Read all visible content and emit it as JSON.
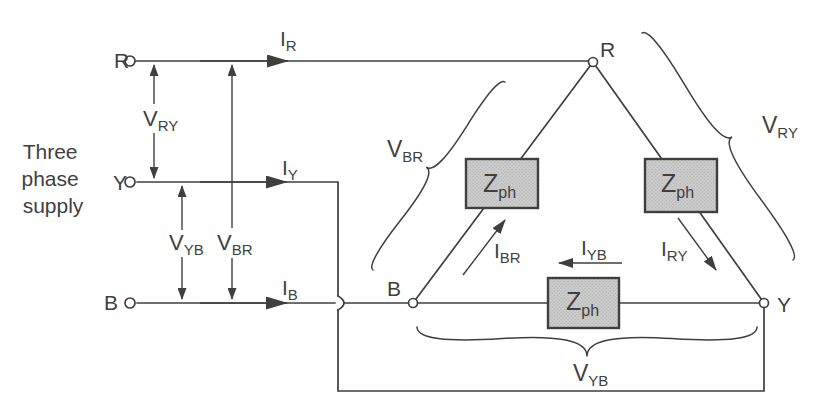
{
  "figure": {
    "source": {
      "lines": [
        "Three",
        "phase",
        "supply"
      ]
    },
    "terminals": {
      "r": "R",
      "y": "Y",
      "b": "B"
    },
    "nodes": {
      "r": "R",
      "b": "B",
      "y": "Y"
    },
    "line_currents": {
      "r": {
        "base": "I",
        "sub": "R"
      },
      "y": {
        "base": "I",
        "sub": "Y"
      },
      "b": {
        "base": "I",
        "sub": "B"
      }
    },
    "line_voltages": {
      "ry": {
        "base": "V",
        "sub": "RY"
      },
      "yb": {
        "base": "V",
        "sub": "YB"
      },
      "br": {
        "base": "V",
        "sub": "BR"
      }
    },
    "phase_currents": {
      "br": {
        "base": "I",
        "sub": "BR"
      },
      "yb": {
        "base": "I",
        "sub": "YB"
      },
      "ry": {
        "base": "I",
        "sub": "RY"
      }
    },
    "phase_voltages": {
      "br": {
        "base": "V",
        "sub": "BR"
      },
      "ry": {
        "base": "V",
        "sub": "RY"
      },
      "yb": {
        "base": "V",
        "sub": "YB"
      }
    },
    "impedances": {
      "left": {
        "base": "Z",
        "sub": "ph"
      },
      "right": {
        "base": "Z",
        "sub": "ph"
      },
      "bottom": {
        "base": "Z",
        "sub": "ph"
      }
    },
    "colors": {
      "ink": "#3f3f3f",
      "box_fill": "#cdcdcd",
      "box_dot": "#a9a9a9",
      "background": "#ffffff"
    }
  }
}
